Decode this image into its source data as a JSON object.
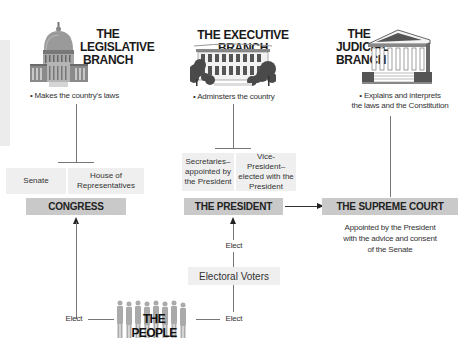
{
  "legislative": {
    "title_line1": "THE",
    "title_line2": "LEGISLATIVE",
    "title_line3": "BRANCH",
    "duty": "• Makes the country's laws",
    "icon": "capitol-building-icon",
    "sub_left": "Senate",
    "sub_right": "House of Representatives",
    "box": "CONGRESS"
  },
  "executive": {
    "title": "THE EXECUTIVE BRANCH",
    "duty": "• Adminsters the country",
    "icon": "white-house-icon",
    "sub_left": "Secretaries– appointed by the President",
    "sub_right": "Vice-President– elected with the President",
    "box": "THE PRESIDENT"
  },
  "judicial": {
    "title_line1": "THE",
    "title_line2": "JUDICIAL",
    "title_line3": "BRANCH",
    "duty_line1": "• Explains and interprets",
    "duty_line2": "the laws and the Constitution",
    "icon": "supreme-court-building-icon",
    "box": "THE SUPREME COURT",
    "note_line1": "Appointed by the President",
    "note_line2": "with the advice and consent",
    "note_line3": "of the Senate"
  },
  "people": {
    "label": "THE PEOPLE",
    "icon": "people-group-icon",
    "elect_left": "Elect",
    "elect_right": "Elect",
    "electoral_voters": "Electoral Voters",
    "elect_president": "Elect"
  },
  "colors": {
    "dark_box": "#c9c9c9",
    "light_box": "#efefef",
    "line": "#777777"
  }
}
